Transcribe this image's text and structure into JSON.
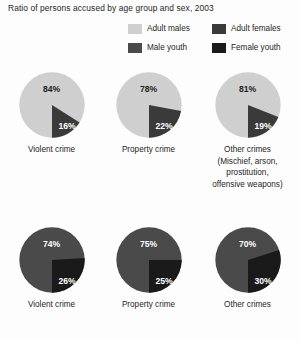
{
  "title": "Ratio of persons accused by age group and sex, 2003",
  "colors": {
    "adult_males": "#cfcfcf",
    "adult_females": "#3a3a3a",
    "male_youth": "#4a4a4a",
    "female_youth": "#1a1a1a",
    "background": "#fdfdfd",
    "text": "#1d1d1d"
  },
  "legend": {
    "rows": [
      [
        {
          "label": "Adult males",
          "color_key": "adult_males",
          "swatch": "#cfcfcf"
        },
        {
          "label": "Adult females",
          "color_key": "adult_females",
          "swatch": "#3a3a3a"
        }
      ],
      [
        {
          "label": "Male youth",
          "color_key": "male_youth",
          "swatch": "#4a4a4a"
        },
        {
          "label": "Female youth",
          "color_key": "female_youth",
          "swatch": "#1a1a1a"
        }
      ]
    ]
  },
  "rows": [
    {
      "group": "adult",
      "major_series": "Adult males",
      "minor_series": "Adult females",
      "major_color": "#cfcfcf",
      "minor_color": "#3a3a3a",
      "major_text_color": "#1d1d1d",
      "pies": [
        {
          "caption": "Violent crime",
          "caption_extra": [],
          "major": "84%",
          "minor": "16%",
          "major_value": 84,
          "minor_value": 16
        },
        {
          "caption": "Property crime",
          "caption_extra": [],
          "major": "78%",
          "minor": "22%",
          "major_value": 78,
          "minor_value": 22
        },
        {
          "caption": "Other crimes",
          "caption_extra": [
            "(Mischief, arson,",
            "prostitution,",
            "offensive weapons)"
          ],
          "major": "81%",
          "minor": "19%",
          "major_value": 81,
          "minor_value": 19
        }
      ]
    },
    {
      "group": "youth",
      "major_series": "Male youth",
      "minor_series": "Female youth",
      "major_color": "#4a4a4a",
      "minor_color": "#1a1a1a",
      "major_text_color": "#ffffff",
      "pies": [
        {
          "caption": "Violent crime",
          "caption_extra": [],
          "major": "74%",
          "minor": "26%",
          "major_value": 74,
          "minor_value": 26
        },
        {
          "caption": "Property crime",
          "caption_extra": [],
          "major": "75%",
          "minor": "25%",
          "major_value": 75,
          "minor_value": 25
        },
        {
          "caption": "Other crimes",
          "caption_extra": [],
          "major": "70%",
          "minor": "30%",
          "major_value": 70,
          "minor_value": 30
        }
      ]
    }
  ],
  "chart_data": {
    "type": "pie",
    "title": "Ratio of persons accused by age group and sex, 2003",
    "xlabel": "",
    "ylabel": "",
    "grid": false,
    "legend_position": "top-right",
    "legend_entries": [
      "Adult males",
      "Adult females",
      "Male youth",
      "Female youth"
    ],
    "categories": [
      "Violent crime",
      "Property crime",
      "Other crimes"
    ],
    "units": "percent",
    "charts": [
      {
        "panel": "adults",
        "category": "Violent crime",
        "slices": [
          {
            "label": "Adult males",
            "value": 84
          },
          {
            "label": "Adult females",
            "value": 16
          }
        ]
      },
      {
        "panel": "adults",
        "category": "Property crime",
        "slices": [
          {
            "label": "Adult males",
            "value": 78
          },
          {
            "label": "Adult females",
            "value": 22
          }
        ]
      },
      {
        "panel": "adults",
        "category": "Other crimes (Mischief, arson, prostitution, offensive weapons)",
        "slices": [
          {
            "label": "Adult males",
            "value": 81
          },
          {
            "label": "Adult females",
            "value": 19
          }
        ]
      },
      {
        "panel": "youth",
        "category": "Violent crime",
        "slices": [
          {
            "label": "Male youth",
            "value": 74
          },
          {
            "label": "Female youth",
            "value": 26
          }
        ]
      },
      {
        "panel": "youth",
        "category": "Property crime",
        "slices": [
          {
            "label": "Male youth",
            "value": 75
          },
          {
            "label": "Female youth",
            "value": 25
          }
        ]
      },
      {
        "panel": "youth",
        "category": "Other crimes",
        "slices": [
          {
            "label": "Male youth",
            "value": 70
          },
          {
            "label": "Female youth",
            "value": 30
          }
        ]
      }
    ]
  }
}
